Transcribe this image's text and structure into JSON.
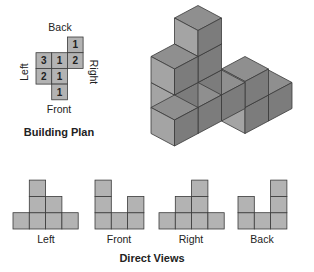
{
  "plan": {
    "title": "Building Plan",
    "labels": {
      "back": "Back",
      "front": "Front",
      "left": "Left",
      "right": "Right"
    },
    "grid": [
      [
        null,
        null,
        1
      ],
      [
        3,
        1,
        2
      ],
      [
        2,
        1,
        null
      ],
      [
        null,
        1,
        null
      ]
    ]
  },
  "views": {
    "title": "Direct Views",
    "items": [
      {
        "label": "Left",
        "heights": [
          1,
          3,
          2,
          1
        ]
      },
      {
        "label": "Front",
        "heights": [
          3,
          1,
          2
        ]
      },
      {
        "label": "Right",
        "heights": [
          1,
          2,
          3,
          1
        ]
      },
      {
        "label": "Back",
        "heights": [
          2,
          1,
          3
        ]
      }
    ]
  },
  "colors": {
    "cell": "#b3b3b3",
    "stroke": "#3a3a3a",
    "top": "#8f8f8f",
    "left_face": "#a4a4a4",
    "right_face": "#7c7c7c"
  }
}
